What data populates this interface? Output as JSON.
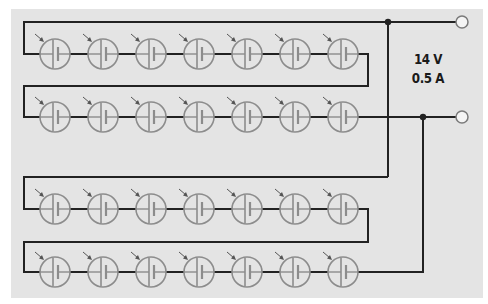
{
  "diagram": {
    "type": "solar-cell-array-circuit",
    "colors": {
      "background": "#e4e4e4",
      "wire": "#222222",
      "cell": "#8c8c8c",
      "terminal": "#7a7a7a"
    },
    "output": {
      "voltage_label": "14 V",
      "current_label": "0.5 A"
    },
    "rows": [
      {
        "name": "row-1",
        "cells": 7,
        "wire_y": 54,
        "top_y": 22
      },
      {
        "name": "row-2",
        "cells": 7,
        "wire_y": 117,
        "top_y": 86
      },
      {
        "name": "row-3",
        "cells": 7,
        "wire_y": 209,
        "top_y": 177
      },
      {
        "name": "row-4",
        "cells": 7,
        "wire_y": 272,
        "top_y": 242
      }
    ],
    "cell_x": [
      55,
      103,
      151,
      199,
      247,
      295,
      343
    ],
    "terminals": [
      {
        "name": "positive-terminal",
        "x": 462,
        "y": 22
      },
      {
        "name": "negative-terminal",
        "x": 462,
        "y": 117
      }
    ],
    "junctions": [
      {
        "name": "top-junction",
        "x": 388,
        "y": 22
      },
      {
        "name": "bottom-junction",
        "x": 423,
        "y": 117
      }
    ]
  }
}
